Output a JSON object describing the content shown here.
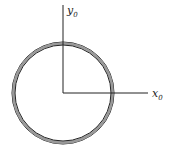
{
  "diagram": {
    "axes": {
      "y_label": "y",
      "y_subscript": "0",
      "x_label": "x",
      "x_subscript": "0"
    },
    "colors": {
      "ring_fill": "#9a9a9a",
      "line": "#222222",
      "background": "#ffffff"
    }
  }
}
